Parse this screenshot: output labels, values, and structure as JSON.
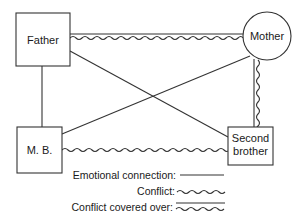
{
  "diagram": {
    "title": "",
    "type": "genogram-relationship-diagram",
    "nodes": [
      {
        "id": "father",
        "label": "Father",
        "shape": "square"
      },
      {
        "id": "mother",
        "label": "Mother",
        "shape": "circle"
      },
      {
        "id": "mb",
        "label": "M. B.",
        "shape": "square"
      },
      {
        "id": "second_brother",
        "label_line1": "Second",
        "label_line2": "brother",
        "shape": "square"
      }
    ],
    "edges": [
      {
        "from": "Father",
        "to": "Mother",
        "relation": "Conflict covered over"
      },
      {
        "from": "Father",
        "to": "M. B.",
        "relation": "Emotional connection"
      },
      {
        "from": "Father",
        "to": "Second brother",
        "relation": "Emotional connection"
      },
      {
        "from": "Mother",
        "to": "M. B.",
        "relation": "Emotional connection"
      },
      {
        "from": "Mother",
        "to": "Second brother",
        "relation": "Conflict covered over"
      },
      {
        "from": "M. B.",
        "to": "Second brother",
        "relation": "Conflict"
      }
    ]
  },
  "legend": {
    "emotional_connection": "Emotional connection:",
    "conflict": "Conflict:",
    "conflict_covered_over": "Conflict covered over:"
  },
  "colors": {
    "stroke": "#333333",
    "background": "#ffffff",
    "text": "#1a1a1a"
  }
}
